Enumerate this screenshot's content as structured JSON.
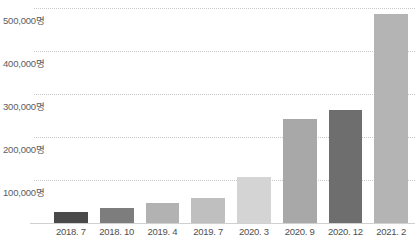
{
  "chart_data": {
    "type": "bar",
    "title": "",
    "subtitle": "",
    "xlabel": "",
    "ylabel": "",
    "categories": [
      "2018. 7",
      "2018. 10",
      "2019. 4",
      "2019. 7",
      "2020. 3",
      "2020. 9",
      "2020. 12",
      "2021. 2"
    ],
    "values": [
      26000,
      35000,
      47000,
      58000,
      108000,
      242000,
      263000,
      487000
    ],
    "unit_suffix": "명",
    "ylim": [
      0,
      500000
    ],
    "yticks": [
      100000,
      200000,
      300000,
      400000,
      500000
    ],
    "ytick_labels": [
      "100,000명",
      "200,000명",
      "300,000명",
      "400,000명",
      "500,000명"
    ],
    "grid": true,
    "grid_style": "dotted",
    "legend": false,
    "legend_position": "none",
    "bar_colors": [
      "#4a4a4a",
      "#7d7d7d",
      "#b2b2b2",
      "#bfbfbf",
      "#d4d4d4",
      "#a8a8a8",
      "#6e6e6e",
      "#b4b4b4"
    ],
    "axis_color": "#d0d0d0",
    "gridline_color": "#c9c9c9",
    "tick_text_color": "#5d5d5d"
  },
  "caption": {
    "text": ""
  }
}
